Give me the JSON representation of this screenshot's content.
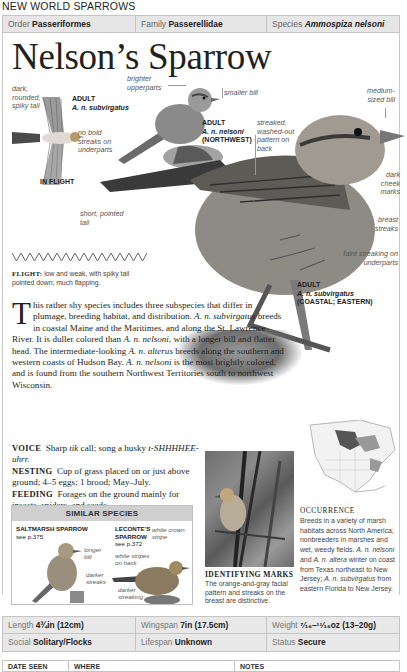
{
  "section": "NEW WORLD SPARROWS",
  "taxonomy": {
    "order_label": "Order",
    "order": "Passeriformes",
    "family_label": "Family",
    "family": "Passerellidae",
    "species_label": "Species",
    "species": "Ammospiza nelsoni"
  },
  "title": "Nelson’s Sparrow",
  "annotations": {
    "tail": "dark, rounded, spiky tail",
    "flight_adult": "ADULT",
    "flight_subsp": "A. n. subvirgatus",
    "no_streaks": "no bold streaks on underparts",
    "in_flight": "IN FLIGHT",
    "brighter": "brighter upperparts",
    "smaller_bill": "smaller bill",
    "nw_adult": "ADULT",
    "nw_subsp": "A. n. nelsoni",
    "nw_region": "(NORTHWEST)",
    "streaked_back": "streaked, washed-out pattern on back",
    "medium_bill": "medium-sized bill",
    "cheek": "dark cheek marks",
    "short_tail": "short, pointed tail",
    "breast": "breast streaks",
    "faint": "faint streaking on underparts",
    "main_adult": "ADULT",
    "main_subsp": "A. n. subvirgatus",
    "main_region": "(COASTAL; EASTERN)"
  },
  "flight": {
    "label": "FLIGHT:",
    "text": "low and weak, with spiky tail pointed down; much flapping."
  },
  "description": {
    "dropcap": "T",
    "p1": "his rather shy species includes three subspecies that differ in plumage, breeding habitat, and distribution. ",
    "s1": "A. n. subvirgatus",
    "p2": " breeds in coastal Maine and the Maritimes, and along the St. Lawrence River. It is duller colored than ",
    "s2": "A. n. nelsoni",
    "p3": ", with a longer bill and flatter head. The intermediate-looking ",
    "s3": "A. n. alterus",
    "p4": " breeds along the southern and western coasts of Hudson Bay. ",
    "s4": "A. n. nelsoni",
    "p5": " is the most brightly colored, and is found from the southern Northwest Territories south to northwest Wisconsin."
  },
  "voice": {
    "label": "VOICE",
    "t1": "Sharp ",
    "i1": "tik",
    "t2": " call; song a husky ",
    "i2": "t-SHHHHEE-uhrr."
  },
  "nesting": {
    "label": "NESTING",
    "text": "Cup of grass placed on or just above ground; 4–5 eggs; 1 brood; May–July."
  },
  "feeding": {
    "label": "FEEDING",
    "text": "Forages on the ground mainly for insects, spiders, and seeds."
  },
  "similar": {
    "heading": "SIMILAR SPECIES",
    "sp1_name": "SALTMARSH SPARROW",
    "sp1_ref": "see p.375",
    "sp1_a1": "longer bill",
    "sp1_a2": "darker streaks",
    "sp2_name": "LECONTE’S SPARROW",
    "sp2_ref": "see p.372",
    "sp2_a1": "white crown stripe",
    "sp2_a2": "white stripes on back",
    "sp2_a3": "darker streaking"
  },
  "identifying": {
    "title": "IDENTIFYING MARKS",
    "text": "The orange-and-gray facial pattern and streaks on the breast are distinctive."
  },
  "occurrence": {
    "title": "OCCURRENCE",
    "t1": "Breeds in a variety of marsh habitats across North America; nonbreeders in marshes and wet, weedy fields. ",
    "i1": "A. n. nelsoni",
    "t2": " and ",
    "i2": "A. n. altera",
    "t3": " winter on coast from Texas northeast to New Jersey; ",
    "i3": "A. n. subvirgatus",
    "t4": " from eastern Florida to New Jersey."
  },
  "facts": {
    "length_label": "Length",
    "length": "4¾in (12cm)",
    "wingspan_label": "Wingspan",
    "wingspan": "7in (17.5cm)",
    "weight_label": "Weight",
    "weight": "⁷⁄₁₆–¹¹⁄₁₆oz (13–20g)",
    "social_label": "Social",
    "social": "Solitary/Flocks",
    "lifespan_label": "Lifespan",
    "lifespan": "Unknown",
    "status_label": "Status",
    "status": "Secure"
  },
  "log": {
    "date": "DATE SEEN",
    "where": "WHERE",
    "notes": "NOTES"
  }
}
